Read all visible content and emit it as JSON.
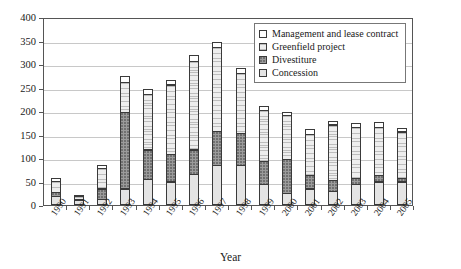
{
  "chart_data": {
    "type": "bar",
    "subtype": "stacked-column",
    "title": "",
    "xlabel": "Year",
    "ylabel": "",
    "ylim": [
      0,
      400
    ],
    "ytick_step": 50,
    "yticks": [
      "0",
      "50",
      "100",
      "150",
      "200",
      "250",
      "300",
      "350",
      "400"
    ],
    "grid": true,
    "legend_position": "inside-top-right",
    "categories": [
      "1990",
      "1991",
      "1992",
      "1993",
      "1994",
      "1995",
      "1996",
      "1997",
      "1998",
      "1999",
      "2000",
      "2001",
      "2002",
      "2003",
      "2004",
      "2005"
    ],
    "series": [
      {
        "name": "Concession",
        "key": "concession",
        "swatch": "light-stipple",
        "color": "#e4e4e4",
        "values": [
          20,
          10,
          12,
          35,
          55,
          50,
          65,
          85,
          85,
          45,
          25,
          35,
          30,
          45,
          50,
          50
        ]
      },
      {
        "name": "Divestiture",
        "key": "divestiture",
        "swatch": "dark-gray",
        "color": "#9b9b9b",
        "values": [
          10,
          3,
          25,
          165,
          65,
          60,
          55,
          75,
          70,
          50,
          75,
          30,
          25,
          15,
          15,
          10
        ]
      },
      {
        "name": "Greenfield project",
        "key": "greenfield",
        "swatch": "light-hatch",
        "color": "#dcdcdc",
        "values": [
          25,
          8,
          45,
          65,
          120,
          150,
          190,
          180,
          130,
          110,
          95,
          90,
          120,
          110,
          105,
          100
        ]
      },
      {
        "name": "Management and lease contract",
        "key": "mgmt",
        "swatch": "white",
        "color": "#ffffff",
        "values": [
          8,
          5,
          8,
          15,
          12,
          12,
          15,
          12,
          12,
          12,
          8,
          12,
          10,
          10,
          12,
          10
        ]
      }
    ],
    "totals": [
      63,
      26,
      90,
      280,
      252,
      272,
      325,
      352,
      297,
      217,
      203,
      167,
      185,
      180,
      182,
      170
    ],
    "stack_order_bottom_to_top": [
      "Concession",
      "Divestiture",
      "Greenfield project",
      "Management and lease contract"
    ]
  },
  "legend": {
    "items": [
      {
        "label": "Management and lease contract"
      },
      {
        "label": "Greenfield project"
      },
      {
        "label": "Divestiture"
      },
      {
        "label": "Concession"
      }
    ]
  },
  "axis": {
    "x_title": "Year"
  }
}
